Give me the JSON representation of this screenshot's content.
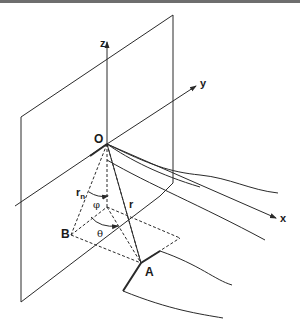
{
  "diagram": {
    "type": "3D coordinate geometry",
    "labels": {
      "origin": "O",
      "z_axis": "z",
      "y_axis": "y",
      "x_axis": "x",
      "point_a": "A",
      "point_b": "B",
      "radius": "r",
      "normal_radius_base": "r",
      "normal_radius_sub": "n",
      "angle_phi": "φ",
      "angle_theta": "θ"
    },
    "colors": {
      "line": "#2a2a2a",
      "text": "#1a1a1a",
      "background": "#ffffff",
      "top_border": "#6e6e6e"
    }
  }
}
